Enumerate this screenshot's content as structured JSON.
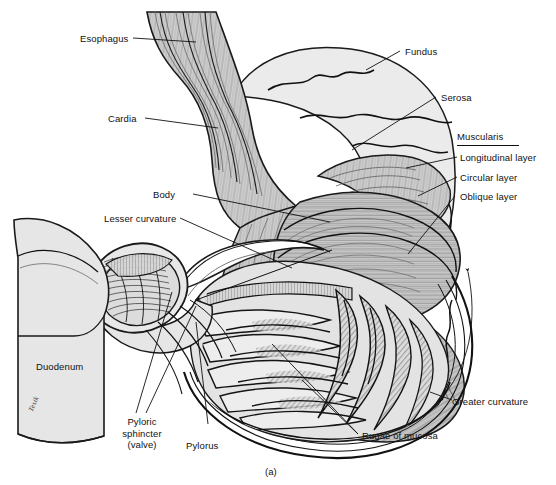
{
  "figure": {
    "caption": "(a)",
    "artist_signature": "Tesik",
    "palette": {
      "ink": "#111111",
      "line": "#1a1a1a",
      "serosa_fill": "#ebebeb",
      "muscle_fill": "#cfcfcf",
      "muscle_dark": "#b6b6b6",
      "mucosa_fill": "#e3e3e3",
      "duodenum_fill": "#e6e6e6",
      "background": "#ffffff"
    }
  },
  "labels": {
    "esophagus": "Esophagus",
    "cardia": "Cardia",
    "fundus": "Fundus",
    "serosa": "Serosa",
    "muscularis_heading": "Muscularis",
    "longitudinal_layer": "Longitudinal layer",
    "circular_layer": "Circular layer",
    "oblique_layer": "Oblique layer",
    "body": "Body",
    "lesser_curvature": "Lesser curvature",
    "greater_curvature": "Greater curvature",
    "duodenum": "Duodenum",
    "pyloric_sphincter": "Pyloric\nsphincter\n(valve)",
    "pylorus": "Pylorus",
    "rugae": "Rugae of mucosa"
  },
  "structures": [
    {
      "name": "esophagus",
      "region": "upper-left tube"
    },
    {
      "name": "cardia",
      "region": "esophago-gastric junction"
    },
    {
      "name": "fundus",
      "region": "upper dome"
    },
    {
      "name": "serosa",
      "region": "outer serous coat"
    },
    {
      "name": "longitudinal-layer",
      "region": "outer muscularis"
    },
    {
      "name": "circular-layer",
      "region": "middle muscularis"
    },
    {
      "name": "oblique-layer",
      "region": "inner muscularis"
    },
    {
      "name": "body",
      "region": "main gastric body"
    },
    {
      "name": "lesser-curvature",
      "region": "right/upper concave border"
    },
    {
      "name": "greater-curvature",
      "region": "lower convex border"
    },
    {
      "name": "pylorus",
      "region": "distal outlet"
    },
    {
      "name": "pyloric-sphincter",
      "region": "ring of circular muscle"
    },
    {
      "name": "duodenum",
      "region": "lower-left continuation"
    },
    {
      "name": "rugae-of-mucosa",
      "region": "internal mucosal folds"
    }
  ]
}
